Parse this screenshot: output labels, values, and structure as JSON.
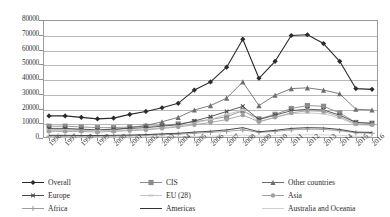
{
  "chart_data": {
    "type": "line",
    "title": "",
    "subtitle": "",
    "xlabel": "",
    "ylabel": "",
    "ylim": [
      0,
      80000
    ],
    "ytick_step": 10000,
    "yticks": [
      "80000",
      "70000",
      "60000",
      "50000",
      "40000",
      "30000",
      "20000",
      "10000",
      "0"
    ],
    "grid": true,
    "legend_position": "bottom",
    "x": [
      "1996",
      "1997",
      "1998",
      "1999",
      "2000",
      "2001",
      "2002",
      "2003",
      "2004",
      "2005",
      "2006",
      "2007",
      "2008",
      "2009",
      "2010",
      "2011",
      "2012",
      "2013",
      "2014",
      "2015",
      "2016"
    ],
    "categories": [
      "1996",
      "1997",
      "1998",
      "1999",
      "2000",
      "2001",
      "2002",
      "2003",
      "2004",
      "2005",
      "2006",
      "2007",
      "2008",
      "2009",
      "2010",
      "2011",
      "2012",
      "2013",
      "2014",
      "2015",
      "2016"
    ],
    "series": [
      {
        "name": "Overall",
        "marker": "diamond",
        "color": "#2b2b2b",
        "values": [
          15000,
          15000,
          14000,
          13000,
          13500,
          16000,
          18000,
          20500,
          23500,
          32500,
          38000,
          48000,
          67000,
          40500,
          52000,
          69500,
          70000,
          64000,
          52000,
          33500,
          33000
        ]
      },
      {
        "name": "CIS",
        "marker": "square",
        "color": "#8c8c8c",
        "values": [
          8000,
          8000,
          7500,
          7000,
          7000,
          7500,
          8000,
          8500,
          9500,
          11000,
          12500,
          14500,
          18500,
          13000,
          16000,
          20000,
          22000,
          21500,
          17000,
          10500,
          10000
        ]
      },
      {
        "name": "Other countries",
        "marker": "triangle",
        "color": "#6e6e6e",
        "values": [
          5500,
          5500,
          5500,
          5000,
          5500,
          7000,
          8500,
          11000,
          14000,
          19000,
          22000,
          27000,
          38000,
          22000,
          29000,
          33500,
          34000,
          32500,
          30000,
          19500,
          19000
        ]
      },
      {
        "name": "Europe",
        "marker": "x",
        "color": "#4a4a4a",
        "values": [
          6500,
          6500,
          6000,
          5500,
          6000,
          6500,
          7000,
          8000,
          9000,
          11500,
          14500,
          18000,
          21500,
          12500,
          15500,
          18500,
          19500,
          19000,
          15500,
          10500,
          10000
        ]
      },
      {
        "name": "EU (28)",
        "marker": "dash",
        "color": "#c6c6c6",
        "values": [
          5500,
          5500,
          5000,
          5000,
          5000,
          5500,
          6000,
          7000,
          8000,
          10000,
          12500,
          16000,
          19000,
          11000,
          14000,
          16500,
          17000,
          16500,
          13500,
          9000,
          8500
        ]
      },
      {
        "name": "Asia",
        "marker": "dot",
        "color": "#a0a0a0",
        "values": [
          4500,
          4500,
          4500,
          4000,
          4500,
          5000,
          5500,
          6500,
          7500,
          9000,
          10500,
          12500,
          15500,
          11000,
          14000,
          17000,
          18500,
          18000,
          14500,
          9500,
          9000
        ]
      },
      {
        "name": "Africa",
        "marker": "plus",
        "color": "#9c9c9c",
        "values": [
          1200,
          1200,
          1200,
          1200,
          1300,
          1500,
          1800,
          2200,
          2600,
          3200,
          3800,
          4500,
          5500,
          3800,
          4500,
          5500,
          6000,
          5800,
          5000,
          3500,
          3200
        ]
      },
      {
        "name": "Americas",
        "marker": "none",
        "color": "#333333",
        "values": [
          1800,
          1800,
          1700,
          1700,
          1800,
          2000,
          2300,
          2800,
          3200,
          4000,
          4600,
          5500,
          7000,
          4200,
          5200,
          6500,
          7000,
          6800,
          5800,
          4000,
          3800
        ]
      },
      {
        "name": "Australia and Oceania",
        "marker": "none",
        "color": "#cfcfcf",
        "values": [
          500,
          500,
          500,
          500,
          500,
          600,
          700,
          800,
          900,
          1100,
          1300,
          1600,
          2000,
          1300,
          1600,
          2000,
          2200,
          2100,
          1800,
          1200,
          1100
        ]
      }
    ]
  },
  "legend": {
    "items": [
      {
        "label": "Overall",
        "marker": "diamond",
        "color": "#2b2b2b"
      },
      {
        "label": "CIS",
        "marker": "square",
        "color": "#8c8c8c"
      },
      {
        "label": "Other countries",
        "marker": "triangle",
        "color": "#6e6e6e"
      },
      {
        "label": "Europe",
        "marker": "x",
        "color": "#4a4a4a"
      },
      {
        "label": "EU (28)",
        "marker": "dash",
        "color": "#c6c6c6"
      },
      {
        "label": "Asia",
        "marker": "dot",
        "color": "#a0a0a0"
      },
      {
        "label": "Africa",
        "marker": "plus",
        "color": "#9c9c9c"
      },
      {
        "label": "Americas",
        "marker": "none",
        "color": "#333333"
      },
      {
        "label": "Australia and Oceania",
        "marker": "none",
        "color": "#cfcfcf"
      }
    ]
  }
}
